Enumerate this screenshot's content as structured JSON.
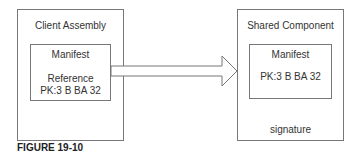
{
  "diagram": {
    "left_box": {
      "title": "Client Assembly",
      "inner": {
        "title": "Manifest",
        "line1": "Reference",
        "line2": "PK:3 B BA 32"
      }
    },
    "right_box": {
      "title": "Shared Component",
      "inner": {
        "title": "Manifest",
        "line1": "PK:3 B BA 32"
      },
      "footer": "signature"
    },
    "arrow": {
      "direction": "right",
      "from": "left_box.inner",
      "to": "right_box"
    }
  },
  "caption": "FIGURE 19-10"
}
